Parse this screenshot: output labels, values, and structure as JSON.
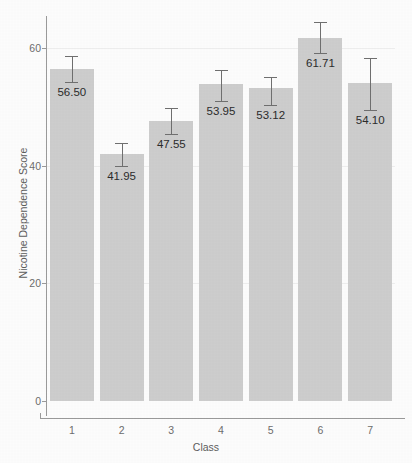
{
  "chart_data": {
    "type": "bar",
    "title": "",
    "xlabel": "Class",
    "ylabel": "Nicotine Dependence Score",
    "categories": [
      "1",
      "2",
      "3",
      "4",
      "5",
      "6",
      "7"
    ],
    "values": [
      56.5,
      41.95,
      47.55,
      53.95,
      53.12,
      61.71,
      54.1
    ],
    "value_labels": [
      "56.50",
      "41.95",
      "47.55",
      "53.95",
      "53.12",
      "61.71",
      "54.10"
    ],
    "error_low": [
      54.3,
      39.9,
      45.4,
      51.0,
      50.3,
      59.2,
      49.5
    ],
    "error_high": [
      58.6,
      43.9,
      49.8,
      56.2,
      55.1,
      64.4,
      58.3
    ],
    "ylim": [
      0,
      64
    ],
    "yticks": [
      0,
      20,
      40,
      60
    ],
    "ytick_labels": [
      "0",
      "20",
      "40",
      "60"
    ],
    "grid": true,
    "legend": "none",
    "bar_color": "#cdcdcd",
    "error_bar_color": "#6f6f6f",
    "axis_color": "#9a9a9a",
    "text_color": "#5c5c5c",
    "background_color": "#fcfcfc"
  }
}
